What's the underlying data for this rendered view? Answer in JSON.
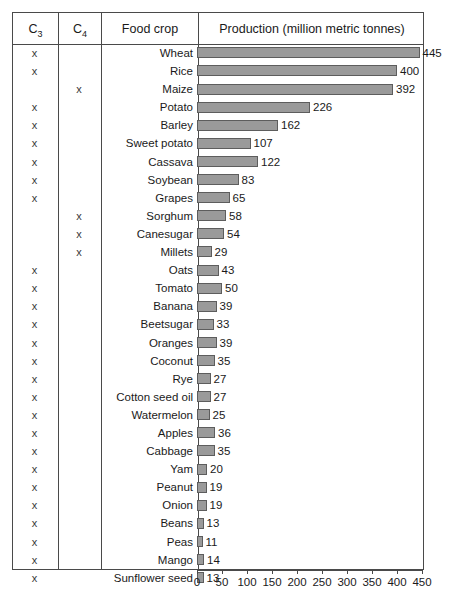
{
  "table": {
    "columns": [
      {
        "label": "C",
        "sub": "3",
        "name": "c3"
      },
      {
        "label": "C",
        "sub": "4",
        "name": "c4"
      },
      {
        "label": "Food crop",
        "sub": "",
        "name": "food-crop"
      },
      {
        "label": "Production (million metric tonnes)",
        "sub": "",
        "name": "production"
      }
    ],
    "mark": "x"
  },
  "chart_data": {
    "type": "bar",
    "orientation": "horizontal",
    "title": "Production (million metric tonnes)",
    "xlabel": "Production (million metric tonnes)",
    "ylabel": "Food crop",
    "xlim": [
      0,
      450
    ],
    "xticks": [
      0,
      50,
      100,
      150,
      200,
      250,
      300,
      350,
      400,
      450
    ],
    "tick_labels": [
      "0",
      "50",
      "100",
      "150",
      "200",
      "250",
      "300",
      "350",
      "400",
      "450"
    ],
    "grid": false,
    "legend": null,
    "bar_color": "#9a9a9a",
    "bar_edge_color": "#5d5d5d",
    "categories": [
      "Wheat",
      "Rice",
      "Maize",
      "Potato",
      "Barley",
      "Sweet potato",
      "Cassava",
      "Soybean",
      "Grapes",
      "Sorghum",
      "Canesugar",
      "Millets",
      "Oats",
      "Tomato",
      "Banana",
      "Beetsugar",
      "Oranges",
      "Coconut",
      "Rye",
      "Cotton seed oil",
      "Watermelon",
      "Apples",
      "Cabbage",
      "Yam",
      "Peanut",
      "Onion",
      "Beans",
      "Peas",
      "Mango",
      "Sunflower seed"
    ],
    "values": [
      445,
      400,
      392,
      226,
      162,
      107,
      122,
      83,
      65,
      58,
      54,
      29,
      43,
      50,
      39,
      33,
      39,
      35,
      27,
      27,
      25,
      36,
      35,
      20,
      19,
      19,
      13,
      11,
      14,
      13
    ],
    "photosynthesis_type": [
      "C3",
      "C3",
      "C4",
      "C3",
      "C3",
      "C3",
      "C3",
      "C3",
      "C3",
      "C4",
      "C4",
      "C4",
      "C3",
      "C3",
      "C3",
      "C3",
      "C3",
      "C3",
      "C3",
      "C3",
      "C3",
      "C3",
      "C3",
      "C3",
      "C3",
      "C3",
      "C3",
      "C3",
      "C3",
      "C3"
    ]
  }
}
